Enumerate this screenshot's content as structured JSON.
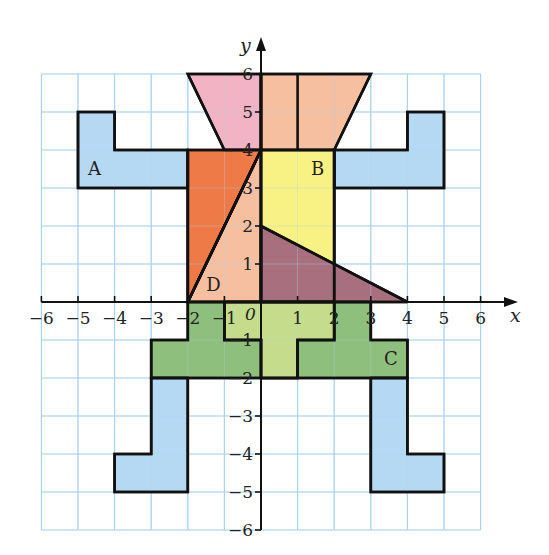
{
  "figure": {
    "axes": {
      "x_label": "x",
      "y_label": "y",
      "origin_label": "0",
      "x_range": [
        -6,
        6
      ],
      "y_range": [
        -6,
        6
      ],
      "x_ticks": [
        "−6",
        "−5",
        "−4",
        "−3",
        "−2",
        "−1",
        "1",
        "2",
        "3",
        "4",
        "5",
        "6"
      ],
      "x_tick_values": [
        -6,
        -5,
        -4,
        -3,
        -2,
        -1,
        1,
        2,
        3,
        4,
        5,
        6
      ],
      "y_ticks": [
        "−6",
        "−5",
        "−4",
        "−3",
        "−2",
        "−1",
        "1",
        "2",
        "3",
        "4",
        "5",
        "6"
      ],
      "y_tick_values": [
        -6,
        -5,
        -4,
        -3,
        -2,
        -1,
        1,
        2,
        3,
        4,
        5,
        6
      ]
    },
    "colors": {
      "grid": "#a9d3ee",
      "outline": "#111111",
      "light_blue": "#b5d9f3",
      "pink": "#f2b3c4",
      "peach": "#f6bfa0",
      "orange": "#ee7a48",
      "yellow": "#f8f184",
      "purple": "#a8707f",
      "light_green": "#c4dc8c",
      "dark_green": "#8fbf7c"
    },
    "shapes": [
      {
        "name": "head-left-pink",
        "fill": "pink",
        "points": [
          [
            -2,
            6
          ],
          [
            0,
            6
          ],
          [
            0,
            4
          ],
          [
            -1,
            4
          ]
        ]
      },
      {
        "name": "head-right-peach",
        "fill": "peach",
        "points": [
          [
            0,
            6
          ],
          [
            3,
            6
          ],
          [
            2,
            4
          ],
          [
            0,
            4
          ]
        ]
      },
      {
        "name": "arm-left-A",
        "fill": "light_blue",
        "points": [
          [
            -5,
            5
          ],
          [
            -4,
            5
          ],
          [
            -4,
            4
          ],
          [
            -2,
            4
          ],
          [
            -2,
            3
          ],
          [
            -5,
            3
          ]
        ]
      },
      {
        "name": "arm-right",
        "fill": "light_blue",
        "points": [
          [
            2,
            4
          ],
          [
            4,
            4
          ],
          [
            4,
            5
          ],
          [
            5,
            5
          ],
          [
            5,
            3
          ],
          [
            2,
            3
          ]
        ]
      },
      {
        "name": "body-orange-triangle",
        "fill": "orange",
        "points": [
          [
            -2,
            0
          ],
          [
            -2,
            4
          ],
          [
            0,
            4
          ]
        ]
      },
      {
        "name": "body-triangle-D",
        "fill": "peach",
        "points": [
          [
            -2,
            0
          ],
          [
            0,
            4
          ],
          [
            0,
            0
          ]
        ]
      },
      {
        "name": "body-rectangle-B",
        "fill": "yellow",
        "points": [
          [
            0,
            4
          ],
          [
            2,
            4
          ],
          [
            2,
            0
          ],
          [
            0,
            0
          ]
        ]
      },
      {
        "name": "body-purple-triangle",
        "fill": "purple",
        "points": [
          [
            0,
            2
          ],
          [
            0,
            0
          ],
          [
            4,
            0
          ]
        ]
      },
      {
        "name": "hips-C-dark",
        "fill": "dark_green",
        "points": [
          [
            -2,
            0
          ],
          [
            3,
            0
          ],
          [
            3,
            -1
          ],
          [
            4,
            -1
          ],
          [
            4,
            -2
          ],
          [
            -3,
            -2
          ],
          [
            -3,
            -1
          ],
          [
            -2,
            -1
          ]
        ]
      },
      {
        "name": "hips-light-center",
        "fill": "light_green",
        "points": [
          [
            -1,
            0
          ],
          [
            2,
            0
          ],
          [
            2,
            -1
          ],
          [
            1,
            -1
          ],
          [
            1,
            -2
          ],
          [
            0,
            -2
          ],
          [
            0,
            -1
          ],
          [
            -1,
            -1
          ]
        ]
      },
      {
        "name": "leg-left",
        "fill": "light_blue",
        "points": [
          [
            -3,
            -2
          ],
          [
            -2,
            -2
          ],
          [
            -2,
            -5
          ],
          [
            -4,
            -5
          ],
          [
            -4,
            -4
          ],
          [
            -3,
            -4
          ]
        ]
      },
      {
        "name": "leg-right",
        "fill": "light_blue",
        "points": [
          [
            3,
            -2
          ],
          [
            4,
            -2
          ],
          [
            4,
            -4
          ],
          [
            5,
            -4
          ],
          [
            5,
            -5
          ],
          [
            3,
            -5
          ]
        ]
      }
    ],
    "inner_lines": [
      [
        [
          0,
          6
        ],
        [
          0,
          4
        ]
      ],
      [
        [
          1,
          6
        ],
        [
          1,
          4
        ]
      ],
      [
        [
          -2,
          4
        ],
        [
          -2,
          0
        ]
      ],
      [
        [
          2,
          4
        ],
        [
          2,
          0
        ]
      ],
      [
        [
          -2,
          0
        ],
        [
          0,
          4
        ]
      ],
      [
        [
          -1,
          0
        ],
        [
          -1,
          -1
        ],
        [
          0,
          -1
        ],
        [
          0,
          -2
        ]
      ],
      [
        [
          1,
          -2
        ],
        [
          1,
          -1
        ],
        [
          2,
          -1
        ],
        [
          2,
          0
        ]
      ]
    ],
    "labels": [
      {
        "text": "A",
        "x": -4.55,
        "y": 3.35
      },
      {
        "text": "B",
        "x": 1.55,
        "y": 3.35
      },
      {
        "text": "C",
        "x": 3.55,
        "y": -1.65
      },
      {
        "text": "D",
        "x": -1.3,
        "y": 0.3
      }
    ]
  },
  "chart_data": {
    "type": "coordinate-grid",
    "title": "",
    "xlabel": "x",
    "ylabel": "y",
    "xlim": [
      -6,
      6
    ],
    "ylim": [
      -6,
      6
    ],
    "grid": true,
    "shapes": {
      "A": [
        [
          -5,
          5
        ],
        [
          -4,
          5
        ],
        [
          -4,
          4
        ],
        [
          -2,
          4
        ],
        [
          -2,
          3
        ],
        [
          -5,
          3
        ]
      ],
      "B": [
        [
          0,
          4
        ],
        [
          2,
          4
        ],
        [
          2,
          0
        ],
        [
          0,
          0
        ]
      ],
      "C": [
        [
          -2,
          0
        ],
        [
          3,
          0
        ],
        [
          3,
          -1
        ],
        [
          4,
          -1
        ],
        [
          4,
          -2
        ],
        [
          -3,
          -2
        ],
        [
          -3,
          -1
        ],
        [
          -2,
          -1
        ]
      ],
      "D": [
        [
          -2,
          0
        ],
        [
          0,
          4
        ],
        [
          0,
          0
        ]
      ],
      "head": [
        [
          -2,
          6
        ],
        [
          3,
          6
        ],
        [
          2,
          4
        ],
        [
          -1,
          4
        ]
      ],
      "purple_triangle": [
        [
          0,
          2
        ],
        [
          0,
          0
        ],
        [
          4,
          0
        ]
      ],
      "orange_triangle": [
        [
          -2,
          0
        ],
        [
          -2,
          4
        ],
        [
          0,
          4
        ]
      ],
      "right_arm": [
        [
          2,
          4
        ],
        [
          4,
          4
        ],
        [
          4,
          5
        ],
        [
          5,
          5
        ],
        [
          5,
          3
        ],
        [
          2,
          3
        ]
      ],
      "left_leg": [
        [
          -3,
          -2
        ],
        [
          -2,
          -2
        ],
        [
          -2,
          -5
        ],
        [
          -4,
          -5
        ],
        [
          -4,
          -4
        ],
        [
          -3,
          -4
        ]
      ],
      "right_leg": [
        [
          3,
          -2
        ],
        [
          4,
          -2
        ],
        [
          4,
          -4
        ],
        [
          5,
          -4
        ],
        [
          5,
          -5
        ],
        [
          3,
          -5
        ]
      ]
    }
  }
}
